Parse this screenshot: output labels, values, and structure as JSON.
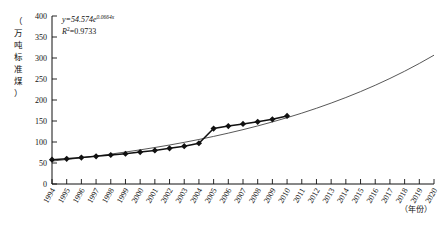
{
  "chart_data": {
    "type": "line",
    "title": "",
    "xlabel": "（年份）",
    "ylabel": "（万吨标准煤）",
    "ylim": [
      0,
      400
    ],
    "ytick_values": [
      0,
      50,
      100,
      150,
      200,
      250,
      300,
      350,
      400
    ],
    "ytick_labels": [
      "0",
      "50",
      "100",
      "150",
      "200",
      "250",
      "300",
      "350",
      "400"
    ],
    "xlim": [
      1994,
      2020
    ],
    "xtick_labels": [
      "1994",
      "1995",
      "1996",
      "1997",
      "1998",
      "1999",
      "2000",
      "2001",
      "2002",
      "2003",
      "2004",
      "2005",
      "2006",
      "2007",
      "2008",
      "2009",
      "2010",
      "2011",
      "2012",
      "2013",
      "2014",
      "2015",
      "2016",
      "2017",
      "2018",
      "2019",
      "2020"
    ],
    "grid": false,
    "legend": "none",
    "annotations": {
      "equation": "y=54.574e",
      "equation_exponent": "0.0664x",
      "r_squared_label": "R",
      "r_squared_sup": "2",
      "r_squared_value": "=0.9733"
    },
    "series": [
      {
        "name": "实测值",
        "marker": "diamond",
        "x": [
          1994,
          1995,
          1996,
          1997,
          1998,
          1999,
          2000,
          2001,
          2002,
          2003,
          2004,
          2005,
          2006,
          2007,
          2008,
          2009,
          2010
        ],
        "values": [
          58,
          60,
          63,
          66,
          69,
          72,
          76,
          80,
          85,
          90,
          97,
          132,
          138,
          143,
          148,
          154,
          162
        ]
      },
      {
        "name": "指数拟合趋势线",
        "marker": "none",
        "x": [
          1994,
          1995,
          1996,
          1997,
          1998,
          1999,
          2000,
          2001,
          2002,
          2003,
          2004,
          2005,
          2006,
          2007,
          2008,
          2009,
          2010,
          2011,
          2012,
          2013,
          2014,
          2015,
          2016,
          2017,
          2018,
          2019,
          2020
        ],
        "values": [
          54.6,
          58.3,
          62.3,
          66.6,
          71.2,
          76.1,
          81.3,
          86.9,
          92.8,
          99.2,
          106.0,
          113.3,
          121.1,
          129.4,
          138.3,
          147.8,
          157.9,
          168.7,
          180.3,
          192.7,
          205.9,
          220.0,
          235.1,
          251.3,
          268.5,
          287.0,
          306.7
        ]
      }
    ]
  }
}
